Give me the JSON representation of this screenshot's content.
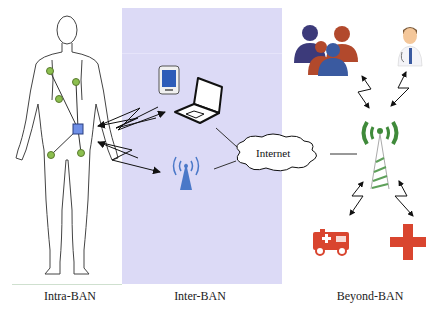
{
  "diagram": {
    "sections": [
      {
        "id": "intra",
        "label": "Intra-BAN"
      },
      {
        "id": "inter",
        "label": "Inter-BAN"
      },
      {
        "id": "beyond",
        "label": "Beyond-BAN"
      }
    ],
    "cloud": {
      "label": "Internet"
    },
    "nodes": {
      "body": "human-body-outline",
      "sensors": [
        "sensor-node",
        "sensor-node",
        "sensor-node",
        "sensor-node",
        "sensor-node"
      ],
      "coordinator": "body-coordinator",
      "inter_devices": [
        "tablet",
        "laptop",
        "wireless-access-point"
      ],
      "beyond_devices": [
        "user-group",
        "doctor",
        "cell-tower",
        "ambulance",
        "medical-cross"
      ]
    },
    "colors": {
      "inter_panel": "#dcdaf6",
      "sensor": "#8cbf4f",
      "coordinator": "#6f8fe6",
      "access_point": "#4a78c8",
      "tower": "#3f8a3a",
      "emergency": "#d9452f",
      "group_dark": "#3c3a7a",
      "group_orange": "#b2492c",
      "group_blue": "#3a5aa0"
    }
  }
}
